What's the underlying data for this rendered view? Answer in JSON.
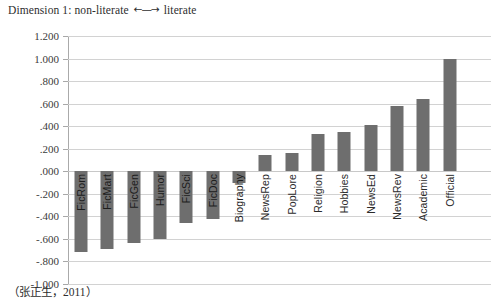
{
  "title": {
    "prefix": "Dimension 1: non-literate ",
    "arrow": "←—→",
    "suffix": " literate"
  },
  "caption": "（张正生，2011）",
  "colors": {
    "bar": "#6e6e6e",
    "gridline": "#d2d2d2",
    "axis": "#aaaaaa",
    "text": "#2e2e2e",
    "background": "#ffffff"
  },
  "chart_data": {
    "type": "bar",
    "title": "Dimension 1: non-literate ←—→ literate",
    "xlabel": "",
    "ylabel": "",
    "ylim": [
      -1.0,
      1.2
    ],
    "ytick_step": 0.2,
    "grid": true,
    "legend": false,
    "orientation": "vertical",
    "categories": [
      "FicRom",
      "FicMart",
      "FicGen",
      "Humor",
      "FicSci",
      "FicDoc",
      "Biography",
      "NewsRep",
      "PopLore",
      "Religion",
      "Hobbies",
      "NewsEd",
      "NewsRev",
      "Academic",
      "Official"
    ],
    "values": [
      -0.72,
      -0.69,
      -0.64,
      -0.6,
      -0.46,
      -0.42,
      -0.1,
      0.14,
      0.16,
      0.33,
      0.35,
      0.41,
      0.58,
      0.64,
      1.0
    ],
    "ytick_labels": [
      "1.200",
      "1.000",
      ".800",
      ".600",
      ".400",
      ".200",
      ".000",
      "-.200",
      "-.400",
      "-.600",
      "-.800",
      "-1.000"
    ],
    "ytick_values": [
      1.2,
      1.0,
      0.8,
      0.6,
      0.4,
      0.2,
      0.0,
      -0.2,
      -0.4,
      -0.6,
      -0.8,
      -1.0
    ]
  }
}
